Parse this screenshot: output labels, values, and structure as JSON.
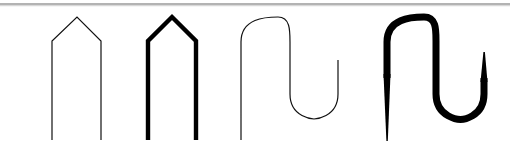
{
  "figure": {
    "background_color": "#ffffff",
    "ink_color": "#000000",
    "rule_color": "#9a9a9a",
    "width": 510,
    "height": 160,
    "separator_rule": {
      "name": "top-horizontal-rule",
      "x1": 0,
      "y1": 4,
      "x2": 510,
      "y2": 4,
      "stroke_width": 1.4,
      "color": "#9a9a9a"
    },
    "shapes": [
      {
        "id": "shape-1",
        "name": "thin-pentagon-arch",
        "label": "thin pentagon arch",
        "kind": "polyline",
        "stroke_width": 1.2,
        "color": "#111111",
        "variable_width": false,
        "points": [
          [
            52,
            140
          ],
          [
            52,
            41
          ],
          [
            77,
            17
          ],
          [
            101,
            41
          ],
          [
            101,
            140
          ]
        ],
        "peak": [
          77,
          17
        ],
        "left_leg_x": 52,
        "right_leg_x": 101,
        "shoulder_y": 41,
        "baseline_y": 140
      },
      {
        "id": "shape-2",
        "name": "thick-pentagon-arch",
        "label": "thick pentagon arch",
        "kind": "polyline",
        "stroke_width": 4.4,
        "color": "#000000",
        "variable_width": false,
        "points": [
          [
            148,
            140
          ],
          [
            148,
            41
          ],
          [
            172,
            17
          ],
          [
            196,
            41
          ],
          [
            196,
            140
          ]
        ],
        "peak": [
          172,
          17
        ],
        "left_leg_x": 148,
        "right_leg_x": 196,
        "shoulder_y": 41,
        "baseline_y": 140
      },
      {
        "id": "shape-3",
        "name": "thin-s-curve",
        "label": "thin S curve",
        "kind": "bezier",
        "stroke_width": 1.2,
        "color": "#111111",
        "variable_width": false,
        "path": "M 241 140 L 241 42 C 241 18 266 17 278 17 C 290 17 290 30 290 42 L 290 94 C 290 118 314 119 314 119 C 314 119 338 118 338 94 L 338 60",
        "top_arch_y": 17,
        "bottom_u_y": 119,
        "left_stem_x": 241,
        "mid_stem_x": 290,
        "right_stem_x": 338,
        "start_point": [
          241,
          140
        ],
        "end_point": [
          338,
          60
        ]
      },
      {
        "id": "shape-4",
        "name": "thick-tapered-s-curve",
        "label": "thick tapered S curve",
        "kind": "variable-width",
        "stroke_width_min": 1.4,
        "stroke_width_max": 7.0,
        "color": "#000000",
        "variable_width": true,
        "path": "M 387 141 L 387 42 C 387 18 412 17 424 17 C 436 17 436 30 436 42 L 436 94 C 436 118 460 119 460 119 C 460 119 484 118 484 94 L 484 52",
        "top_arch_y": 17,
        "bottom_u_y": 119,
        "left_stem_x": 387,
        "mid_stem_x": 436,
        "right_stem_x": 484,
        "start_point": [
          387,
          141
        ],
        "end_point": [
          484,
          52
        ],
        "taper_note": "tails thin at the free ends, body thick through the arches"
      }
    ]
  }
}
